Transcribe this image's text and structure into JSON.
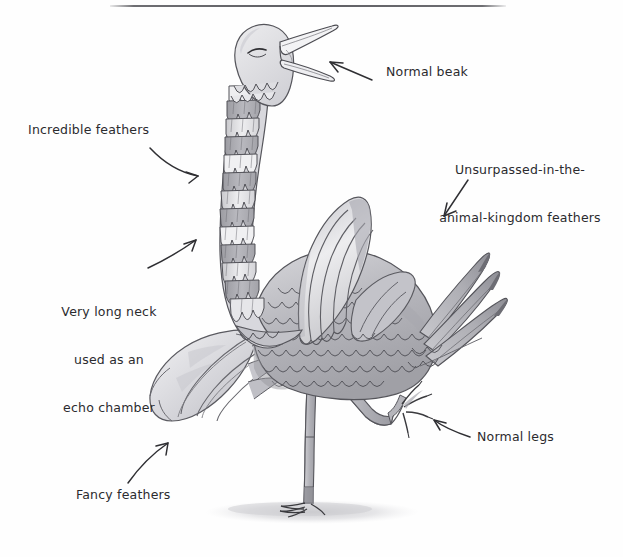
{
  "figure": {
    "title_rule": "horizontal-rule",
    "medium": "hand-drawn pencil and watercolor diagram",
    "background_color": "#fefefe",
    "ink_color": "#2b2b2e",
    "palette": {
      "ink": "#3a3a3e",
      "light_gray": "#e4e4e6",
      "mid_gray": "#bdbdc1",
      "dark_gray": "#98989e",
      "shadow_gray": "#cfcfd2",
      "paper": "#fefefe"
    }
  },
  "callouts": [
    {
      "id": "normal-beak",
      "text": "Normal beak",
      "x": 386,
      "y": 71,
      "arrow": "straight-arrow-pointing-upper-left",
      "points_to": "beak"
    },
    {
      "id": "incredible-feathers",
      "text": "Incredible feathers",
      "x": 28,
      "y": 122,
      "arrow": "curved-arrow-pointing-right",
      "points_to": "neck-feathers"
    },
    {
      "id": "unsurpassed-feathers",
      "line1": "Unsurpassed-in-the-",
      "line2": "animal-kingdom feathers",
      "text": "Unsurpassed-in-the-\nanimal-kingdom feathers",
      "x": 434,
      "y": 136,
      "arrow": "curved-arrow-pointing-lower-left",
      "points_to": "tail-feathers"
    },
    {
      "id": "very-long-neck",
      "line1": "Very long neck",
      "line2": "used as an",
      "line3": "echo chamber",
      "text": "Very long neck\nused as an\necho chamber",
      "x": 44,
      "y": 273,
      "arrow": "curved-arrow-pointing-upper-right",
      "points_to": "neck"
    },
    {
      "id": "normal-legs",
      "text": "Normal legs",
      "x": 477,
      "y": 429,
      "arrow": "curved-arrow-pointing-upper-left",
      "points_to": "raised-leg"
    },
    {
      "id": "fancy-feathers",
      "text": "Fancy feathers",
      "x": 76,
      "y": 487,
      "arrow": "curved-arrow-pointing-upper-right",
      "points_to": "left-plume"
    }
  ],
  "anatomy": [
    {
      "id": "head",
      "label": "head"
    },
    {
      "id": "eye",
      "label": "closed-eye"
    },
    {
      "id": "beak",
      "label": "open-beak"
    },
    {
      "id": "neck",
      "label": "long-banded-neck"
    },
    {
      "id": "body",
      "label": "feathered-body"
    },
    {
      "id": "wing-plume",
      "label": "raised-wing-plume"
    },
    {
      "id": "tail-feathers",
      "label": "long-tail-feathers"
    },
    {
      "id": "left-plume",
      "label": "draping-left-plume"
    },
    {
      "id": "standing-leg",
      "label": "standing-leg"
    },
    {
      "id": "raised-leg",
      "label": "raised-leg"
    },
    {
      "id": "ground-shadow",
      "label": "ground-shadow"
    }
  ]
}
